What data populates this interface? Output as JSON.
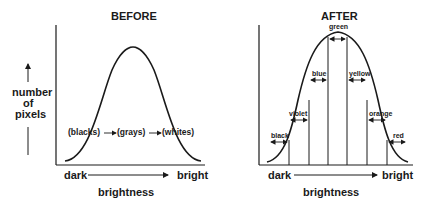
{
  "before": {
    "title": "BEFORE",
    "ylabel": [
      "number",
      "of",
      "pixels"
    ],
    "xlabel": "brightness",
    "x_left": "dark",
    "x_right": "bright",
    "regions": [
      "(blacks)",
      "(grays)",
      "(whites)"
    ]
  },
  "after": {
    "title": "AFTER",
    "xlabel": "brightness",
    "x_left": "dark",
    "x_right": "bright",
    "bands": [
      "black",
      "violet",
      "blue",
      "green",
      "yellow",
      "orange",
      "red"
    ]
  },
  "colors": {
    "ink": "#1a1a1a",
    "background": "#ffffff"
  }
}
